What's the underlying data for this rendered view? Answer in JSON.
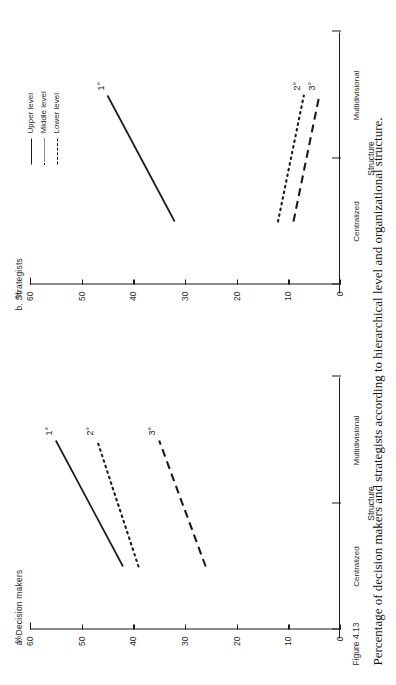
{
  "figure": {
    "number": "Figure 4.13",
    "caption": "Percentage of decision makers and strategists according to hierarchical level and organizational structure."
  },
  "legend": {
    "items": [
      {
        "label": "Upper level",
        "style": "solid"
      },
      {
        "label": "Middle level",
        "style": "dotted"
      },
      {
        "label": "Lower level",
        "style": "dashed"
      }
    ]
  },
  "axes": {
    "y_unit": "%",
    "y_ticks": [
      "60",
      "50",
      "40",
      "30",
      "20",
      "10",
      "0"
    ],
    "x_title": "Structure",
    "x_categories": [
      "Centralized",
      "Multidivisional"
    ]
  },
  "chart_data": [
    {
      "type": "line",
      "title": "a. Decision makers",
      "xlabel": "Structure",
      "ylabel": "%",
      "ylim": [
        0,
        60
      ],
      "grid": false,
      "legend_position": "none",
      "categories": [
        "Centralized",
        "Multidivisional"
      ],
      "series": [
        {
          "name": "Upper level",
          "label": "1°",
          "style": "solid",
          "values": [
            42,
            55
          ]
        },
        {
          "name": "Middle level",
          "label": "2°",
          "style": "dotted",
          "values": [
            39,
            47
          ]
        },
        {
          "name": "Lower level",
          "label": "3°",
          "style": "dashed",
          "values": [
            26,
            35
          ]
        }
      ]
    },
    {
      "type": "line",
      "title": "b. Strategists",
      "xlabel": "Structure",
      "ylabel": "%",
      "ylim": [
        0,
        60
      ],
      "grid": false,
      "legend_position": "top-right",
      "categories": [
        "Centralized",
        "Multidivisional"
      ],
      "series": [
        {
          "name": "Upper level",
          "label": "1°",
          "style": "solid",
          "values": [
            32,
            45
          ]
        },
        {
          "name": "Middle level",
          "label": "2°",
          "style": "dotted",
          "values": [
            12,
            7
          ]
        },
        {
          "name": "Lower level",
          "label": "3°",
          "style": "dashed",
          "values": [
            9,
            4
          ]
        }
      ]
    }
  ]
}
